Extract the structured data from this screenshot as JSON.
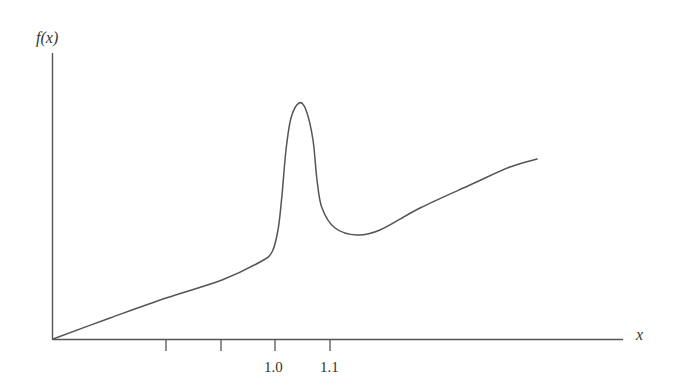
{
  "chart_data": {
    "type": "line",
    "title": "",
    "xlabel": "x",
    "ylabel": "f(x)",
    "x_ticks": [
      {
        "pos": 166,
        "label": ""
      },
      {
        "pos": 221,
        "label": ""
      },
      {
        "pos": 275,
        "label": "1.0"
      },
      {
        "pos": 330,
        "label": "1.1"
      }
    ],
    "y_ticks": [],
    "grid": false,
    "legend": null,
    "series": [
      {
        "name": "f(x)",
        "description": "Qualitative curve: rises smoothly from origin, sharp resonance peak just above x=1.0, dips to a minimum past x=1.1, then rises gradually",
        "points_px": [
          [
            53,
            339
          ],
          [
            110,
            318
          ],
          [
            166,
            298
          ],
          [
            222,
            280
          ],
          [
            260,
            262
          ],
          [
            272,
            252
          ],
          [
            278,
            230
          ],
          [
            282,
            195
          ],
          [
            286,
            150
          ],
          [
            291,
            118
          ],
          [
            299,
            103
          ],
          [
            306,
            110
          ],
          [
            313,
            140
          ],
          [
            317,
            180
          ],
          [
            322,
            208
          ],
          [
            335,
            228
          ],
          [
            357,
            235
          ],
          [
            380,
            230
          ],
          [
            420,
            208
          ],
          [
            470,
            185
          ],
          [
            510,
            167
          ],
          [
            537,
            159
          ]
        ]
      }
    ],
    "colors": {
      "line": "#555555",
      "axis": "#555555",
      "text": "#333333"
    }
  },
  "labels": {
    "y_axis": "f(x)",
    "x_axis": "x",
    "tick_1": "1.0",
    "tick_2": "1.1"
  }
}
